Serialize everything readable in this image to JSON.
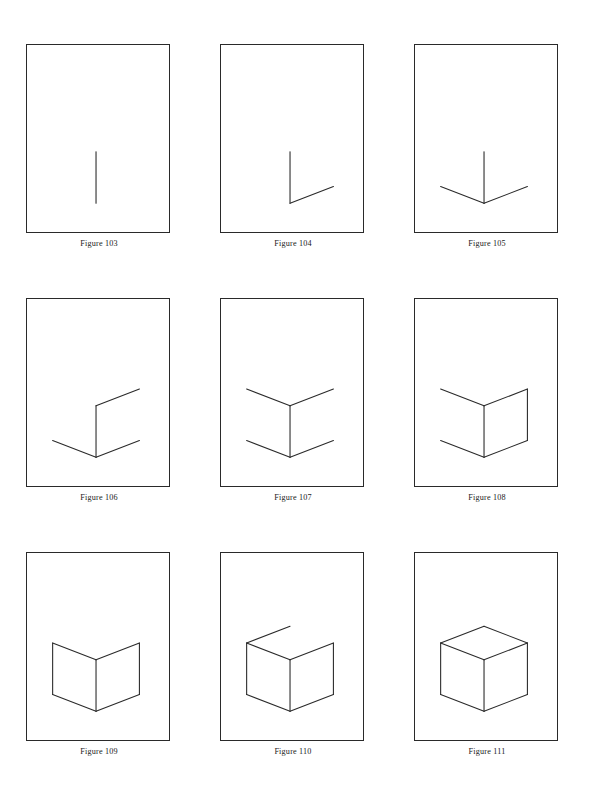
{
  "sheet": {
    "title": "Progressive construction of a cube",
    "background_color": "#ffffff",
    "ink_color": "#2a2a2a",
    "page_width": 590,
    "page_height": 798,
    "grid": {
      "columns": 3,
      "rows": 3
    }
  },
  "chart_data": {
    "type": "diagram",
    "panel_frame": {
      "width": 144,
      "height": 189,
      "stroke": "#2a2a2a"
    },
    "coordinate_space": {
      "width": 144,
      "height": 189,
      "units": "panel pixels"
    },
    "panels": [
      {
        "caption": "Figure 103",
        "segment_count": 1,
        "added": "front vertical edge",
        "segments": [
          {
            "name": "front-vertical",
            "x1": 70,
            "y1": 108,
            "x2": 70,
            "y2": 160
          }
        ]
      },
      {
        "caption": "Figure 104",
        "segment_count": 2,
        "added": "bottom-right edge",
        "segments": [
          {
            "name": "front-vertical",
            "x1": 70,
            "y1": 108,
            "x2": 70,
            "y2": 160
          },
          {
            "name": "bottom-right",
            "x1": 70,
            "y1": 160,
            "x2": 114,
            "y2": 143
          }
        ]
      },
      {
        "caption": "Figure 105",
        "segment_count": 3,
        "added": "bottom-left edge",
        "segments": [
          {
            "name": "front-vertical",
            "x1": 70,
            "y1": 108,
            "x2": 70,
            "y2": 160
          },
          {
            "name": "bottom-right",
            "x1": 70,
            "y1": 160,
            "x2": 114,
            "y2": 143
          },
          {
            "name": "bottom-left",
            "x1": 70,
            "y1": 160,
            "x2": 26,
            "y2": 143
          }
        ]
      },
      {
        "caption": "Figure 106",
        "segment_count": 4,
        "added": "top-right edge",
        "segments": [
          {
            "name": "front-vertical",
            "x1": 70,
            "y1": 108,
            "x2": 70,
            "y2": 160
          },
          {
            "name": "bottom-right",
            "x1": 70,
            "y1": 160,
            "x2": 114,
            "y2": 143
          },
          {
            "name": "bottom-left",
            "x1": 70,
            "y1": 160,
            "x2": 26,
            "y2": 143
          },
          {
            "name": "top-right",
            "x1": 70,
            "y1": 108,
            "x2": 114,
            "y2": 91
          }
        ]
      },
      {
        "caption": "Figure 107",
        "segment_count": 5,
        "added": "top-left edge",
        "segments": [
          {
            "name": "front-vertical",
            "x1": 70,
            "y1": 108,
            "x2": 70,
            "y2": 160
          },
          {
            "name": "bottom-right",
            "x1": 70,
            "y1": 160,
            "x2": 114,
            "y2": 143
          },
          {
            "name": "bottom-left",
            "x1": 70,
            "y1": 160,
            "x2": 26,
            "y2": 143
          },
          {
            "name": "top-right",
            "x1": 70,
            "y1": 108,
            "x2": 114,
            "y2": 91
          },
          {
            "name": "top-left",
            "x1": 70,
            "y1": 108,
            "x2": 26,
            "y2": 91
          }
        ]
      },
      {
        "caption": "Figure 108",
        "segment_count": 6,
        "added": "right vertical edge",
        "segments": [
          {
            "name": "front-vertical",
            "x1": 70,
            "y1": 108,
            "x2": 70,
            "y2": 160
          },
          {
            "name": "bottom-right",
            "x1": 70,
            "y1": 160,
            "x2": 114,
            "y2": 143
          },
          {
            "name": "bottom-left",
            "x1": 70,
            "y1": 160,
            "x2": 26,
            "y2": 143
          },
          {
            "name": "top-right",
            "x1": 70,
            "y1": 108,
            "x2": 114,
            "y2": 91
          },
          {
            "name": "top-left",
            "x1": 70,
            "y1": 108,
            "x2": 26,
            "y2": 91
          },
          {
            "name": "right-vertical",
            "x1": 114,
            "y1": 91,
            "x2": 114,
            "y2": 143
          }
        ]
      },
      {
        "caption": "Figure 109",
        "segment_count": 7,
        "added": "left vertical edge",
        "segments": [
          {
            "name": "front-vertical",
            "x1": 70,
            "y1": 108,
            "x2": 70,
            "y2": 160
          },
          {
            "name": "bottom-right",
            "x1": 70,
            "y1": 160,
            "x2": 114,
            "y2": 143
          },
          {
            "name": "bottom-left",
            "x1": 70,
            "y1": 160,
            "x2": 26,
            "y2": 143
          },
          {
            "name": "top-right",
            "x1": 70,
            "y1": 108,
            "x2": 114,
            "y2": 91
          },
          {
            "name": "top-left",
            "x1": 70,
            "y1": 108,
            "x2": 26,
            "y2": 91
          },
          {
            "name": "right-vertical",
            "x1": 114,
            "y1": 91,
            "x2": 114,
            "y2": 143
          },
          {
            "name": "left-vertical",
            "x1": 26,
            "y1": 91,
            "x2": 26,
            "y2": 143
          }
        ]
      },
      {
        "caption": "Figure 110",
        "segment_count": 8,
        "added": "top-face left edge",
        "segments": [
          {
            "name": "front-vertical",
            "x1": 70,
            "y1": 108,
            "x2": 70,
            "y2": 160
          },
          {
            "name": "bottom-right",
            "x1": 70,
            "y1": 160,
            "x2": 114,
            "y2": 143
          },
          {
            "name": "bottom-left",
            "x1": 70,
            "y1": 160,
            "x2": 26,
            "y2": 143
          },
          {
            "name": "top-right",
            "x1": 70,
            "y1": 108,
            "x2": 114,
            "y2": 91
          },
          {
            "name": "top-left",
            "x1": 70,
            "y1": 108,
            "x2": 26,
            "y2": 91
          },
          {
            "name": "right-vertical",
            "x1": 114,
            "y1": 91,
            "x2": 114,
            "y2": 143
          },
          {
            "name": "left-vertical",
            "x1": 26,
            "y1": 91,
            "x2": 26,
            "y2": 143
          },
          {
            "name": "top-face-left",
            "x1": 26,
            "y1": 91,
            "x2": 70,
            "y2": 74
          }
        ]
      },
      {
        "caption": "Figure 111",
        "segment_count": 9,
        "added": "top-face right edge (cube complete)",
        "segments": [
          {
            "name": "front-vertical",
            "x1": 70,
            "y1": 108,
            "x2": 70,
            "y2": 160
          },
          {
            "name": "bottom-right",
            "x1": 70,
            "y1": 160,
            "x2": 114,
            "y2": 143
          },
          {
            "name": "bottom-left",
            "x1": 70,
            "y1": 160,
            "x2": 26,
            "y2": 143
          },
          {
            "name": "top-right",
            "x1": 70,
            "y1": 108,
            "x2": 114,
            "y2": 91
          },
          {
            "name": "top-left",
            "x1": 70,
            "y1": 108,
            "x2": 26,
            "y2": 91
          },
          {
            "name": "right-vertical",
            "x1": 114,
            "y1": 91,
            "x2": 114,
            "y2": 143
          },
          {
            "name": "left-vertical",
            "x1": 26,
            "y1": 91,
            "x2": 26,
            "y2": 143
          },
          {
            "name": "top-face-left",
            "x1": 26,
            "y1": 91,
            "x2": 70,
            "y2": 74
          },
          {
            "name": "top-face-right",
            "x1": 114,
            "y1": 91,
            "x2": 70,
            "y2": 74
          }
        ]
      }
    ]
  }
}
